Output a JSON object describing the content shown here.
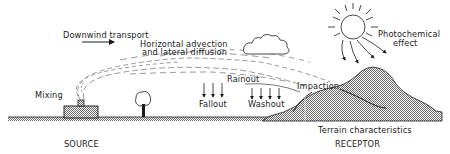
{
  "diagram": {
    "type": "process-schematic",
    "labels": {
      "downwind": "Downwind transport",
      "advection_line1": "Horizontal advection",
      "advection_line2": "and lateral diffusion",
      "mixing": "Mixing",
      "rainout": "Rainout",
      "fallout": "Fallout",
      "washout": "Washout",
      "impaction": "Impaction",
      "photochem_line1": "Photochemical",
      "photochem_line2": "effect",
      "terrain": "Terrain characteristics",
      "source": "SOURCE",
      "receptor": "RECEPTOR"
    },
    "elements": [
      {
        "id": "factory",
        "icon": "factory-icon",
        "role": "emission source with stack"
      },
      {
        "id": "plume",
        "icon": "plume-icon",
        "role": "dispersing emission plume"
      },
      {
        "id": "tree",
        "icon": "tree-icon",
        "role": "vegetation on ground"
      },
      {
        "id": "cloud",
        "icon": "cloud-icon",
        "role": "cloud"
      },
      {
        "id": "sun",
        "icon": "sun-icon",
        "role": "sunlight driving photochemistry"
      },
      {
        "id": "hill",
        "icon": "hill-icon",
        "role": "receptor terrain"
      },
      {
        "id": "wind-arrow",
        "icon": "arrow-right-icon",
        "role": "wind direction"
      }
    ],
    "colors": {
      "ink": "#1a1a1a",
      "hatch": "#9a9a9a",
      "background": "#ffffff"
    }
  }
}
